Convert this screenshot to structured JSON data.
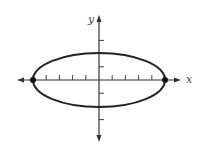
{
  "chart_data": {
    "type": "line",
    "title": "",
    "subtitle": "",
    "xlabel": "x",
    "ylabel": "y",
    "equation_implied": "x^2/25 + y^2/4 = 1",
    "curve": "ellipse",
    "center": [
      0,
      0
    ],
    "semi_major_axis": 5,
    "semi_minor_axis": 2,
    "vertices": [
      [
        -5,
        0
      ],
      [
        5,
        0
      ]
    ],
    "co_vertices": [
      [
        0,
        2
      ],
      [
        0,
        -2
      ]
    ],
    "highlighted_points": [
      [
        -5,
        0
      ],
      [
        5,
        0
      ]
    ],
    "x_ticks": [
      -5,
      -4,
      -3,
      -2,
      -1,
      1,
      2,
      3,
      4,
      5
    ],
    "y_ticks": [
      -3,
      -2,
      -1,
      1,
      2,
      3
    ],
    "xlim": [
      -5.5,
      5.8
    ],
    "ylim": [
      -4,
      4.2
    ],
    "tick_labels_shown": false,
    "grid": false,
    "legend": null,
    "axes_arrows": true
  },
  "labels": {
    "x_axis": "x",
    "y_axis": "y"
  },
  "colors": {
    "curve": "#222222",
    "axes": "#333333",
    "points": "#111111"
  }
}
